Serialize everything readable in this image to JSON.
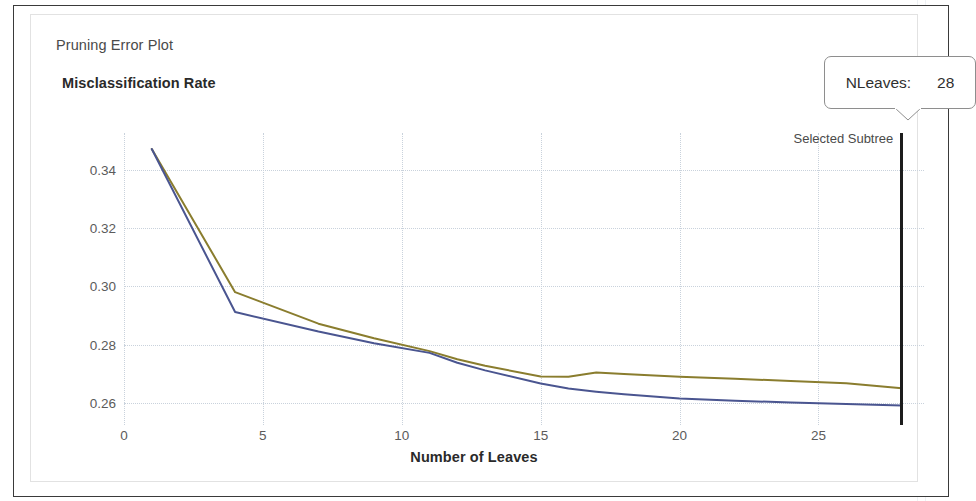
{
  "panel": {
    "plot_title": "Pruning Error Plot"
  },
  "callout": {
    "name": "nleaves-callout",
    "label": "NLeaves:",
    "value": "28"
  },
  "marker": {
    "label": "Selected Subtree",
    "x_value": 28,
    "color": "#1d1d1d"
  },
  "chart_data": {
    "type": "line",
    "title": "Pruning Error Plot",
    "xlabel": "Number of Leaves",
    "ylabel": "Misclassification Rate",
    "xlim": [
      0,
      28.8
    ],
    "ylim": [
      0.2525,
      0.3525
    ],
    "xticks": [
      0,
      5,
      10,
      15,
      20,
      25
    ],
    "yticks": [
      0.26,
      0.28,
      0.3,
      0.32,
      0.34
    ],
    "ytick_labels": [
      "0.26",
      "0.28",
      "0.30",
      "0.32",
      "0.34"
    ],
    "xtick_labels": [
      "0",
      "5",
      "10",
      "15",
      "20",
      "25"
    ],
    "grid": true,
    "legend": null,
    "series": [
      {
        "name": "cross-validated-error",
        "color": "#8a7d2e",
        "x": [
          1,
          4,
          7,
          9,
          11,
          12,
          13,
          15,
          16,
          17,
          18,
          20,
          22,
          24,
          26,
          28
        ],
        "values": [
          0.347,
          0.298,
          0.2872,
          0.2822,
          0.2778,
          0.275,
          0.2728,
          0.2691,
          0.269,
          0.2705,
          0.27,
          0.269,
          0.2683,
          0.2676,
          0.2668,
          0.2651
        ]
      },
      {
        "name": "resubstitution-error",
        "color": "#4a5590",
        "x": [
          1,
          4,
          7,
          9,
          11,
          12,
          13,
          15,
          16,
          17,
          18,
          20,
          22,
          24,
          26,
          28
        ],
        "values": [
          0.347,
          0.2912,
          0.2845,
          0.2805,
          0.2772,
          0.2738,
          0.2712,
          0.2667,
          0.265,
          0.2639,
          0.263,
          0.2616,
          0.2608,
          0.2602,
          0.2597,
          0.2592
        ]
      }
    ],
    "annotations": [
      {
        "text": "Selected Subtree",
        "x": 28
      }
    ]
  }
}
